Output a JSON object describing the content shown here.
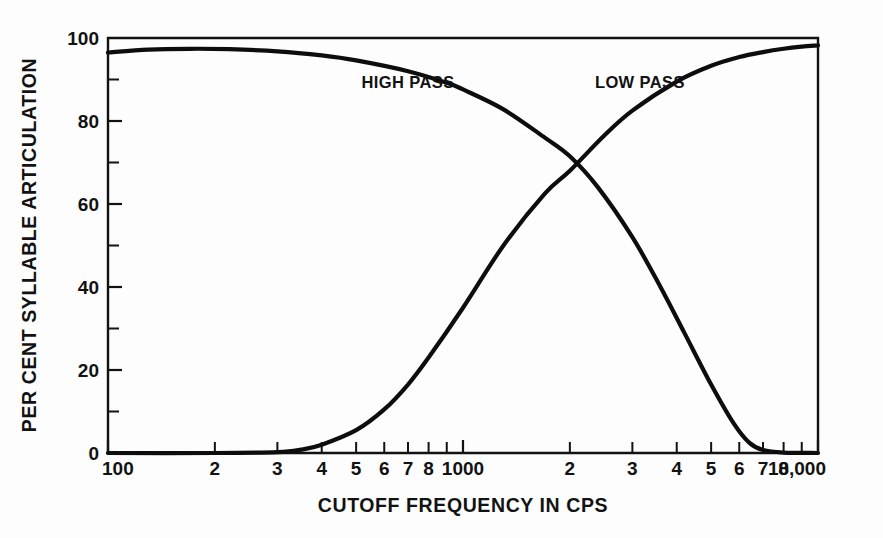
{
  "chart_data": {
    "type": "line",
    "title": "",
    "xlabel": "CUTOFF FREQUENCY IN CPS",
    "ylabel": "PER CENT SYLLABLE ARTICULATION",
    "xscale": "log",
    "xlim": [
      100,
      10000
    ],
    "ylim": [
      0,
      100
    ],
    "grid": false,
    "legend_position": "inline-annotation",
    "x_tick_labels": [
      "100",
      "2",
      "3",
      "4",
      "5",
      "6",
      "7",
      "8",
      "1000",
      "2",
      "3",
      "4",
      "5",
      "6",
      "7",
      "8",
      "10,000"
    ],
    "x_tick_values": [
      100,
      200,
      300,
      400,
      500,
      600,
      700,
      800,
      1000,
      2000,
      3000,
      4000,
      5000,
      6000,
      7000,
      8000,
      10000
    ],
    "y_tick_labels": [
      "0",
      "20",
      "40",
      "60",
      "80",
      "100"
    ],
    "y_tick_values": [
      0,
      20,
      40,
      60,
      80,
      100
    ],
    "y_minor_tick_values": [
      10,
      30,
      50,
      70,
      90
    ],
    "series": [
      {
        "name": "HIGH PASS",
        "label_x": 700,
        "label_y": 88,
        "x": [
          100,
          130,
          170,
          220,
          300,
          400,
          500,
          700,
          900,
          1000,
          1300,
          1700,
          2000,
          2400,
          3000,
          3600,
          4200,
          5000,
          5800,
          6400,
          7000,
          8000,
          10000
        ],
        "y": [
          96.5,
          97.2,
          97.4,
          97.3,
          96.8,
          95.8,
          94.6,
          92.0,
          89.2,
          87.6,
          82.8,
          76.0,
          71.5,
          64.0,
          52.0,
          40.0,
          29.0,
          16.5,
          7.0,
          2.5,
          0.7,
          0.1,
          0.0
        ]
      },
      {
        "name": "LOW PASS",
        "label_x": 3150,
        "label_y": 88,
        "x": [
          100,
          200,
          300,
          350,
          400,
          500,
          600,
          700,
          800,
          1000,
          1300,
          1700,
          2000,
          2500,
          3000,
          4000,
          5000,
          6000,
          7000,
          8000,
          9000,
          10000
        ],
        "y": [
          0.0,
          0.0,
          0.2,
          0.8,
          2.0,
          5.5,
          10.5,
          16.5,
          23.0,
          35.0,
          50.0,
          62.5,
          68.0,
          76.5,
          82.5,
          89.5,
          93.3,
          95.4,
          96.6,
          97.4,
          97.9,
          98.2
        ]
      }
    ],
    "crossover": {
      "x": 1980,
      "y": 68
    }
  },
  "figure": {
    "background_color": "#fdfdfd",
    "line_color": "#0d0d0d",
    "text_color": "#121212"
  }
}
